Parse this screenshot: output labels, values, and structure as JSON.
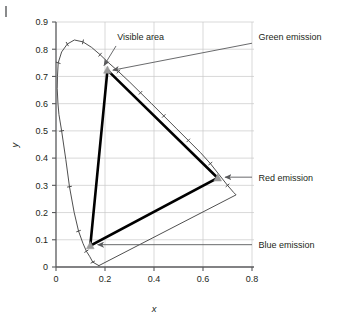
{
  "figure": {
    "corner_mark": "|",
    "background": "#ffffff"
  },
  "chart_data": {
    "type": "line",
    "title": "",
    "xlabel": "x",
    "ylabel": "y",
    "xlim": [
      0,
      0.8
    ],
    "ylim": [
      0,
      0.9
    ],
    "xticks": [
      "0",
      "0.2",
      "0.4",
      "0.6",
      "0.8"
    ],
    "xtick_values": [
      0,
      0.2,
      0.4,
      0.6,
      0.8
    ],
    "yticks": [
      "0",
      "0.1",
      "0.2",
      "0.3",
      "0.4",
      "0.5",
      "0.6",
      "0.7",
      "0.8",
      "0.9"
    ],
    "ytick_values": [
      0,
      0.1,
      0.2,
      0.3,
      0.4,
      0.5,
      0.6,
      0.7,
      0.8,
      0.9
    ],
    "grid": true,
    "grid_color": "#c8c8c8",
    "axis_color": "#58595b",
    "legend": "none",
    "series": [
      {
        "name": "Visible area",
        "kind": "spectral-locus",
        "color": "#3b3b3b",
        "closed": true,
        "points": [
          [
            0.175,
            0.005
          ],
          [
            0.15,
            0.018
          ],
          [
            0.138,
            0.038
          ],
          [
            0.124,
            0.058
          ],
          [
            0.11,
            0.087
          ],
          [
            0.092,
            0.132
          ],
          [
            0.074,
            0.201
          ],
          [
            0.055,
            0.295
          ],
          [
            0.04,
            0.395
          ],
          [
            0.023,
            0.5
          ],
          [
            0.012,
            0.56
          ],
          [
            0.008,
            0.6
          ],
          [
            0.005,
            0.655
          ],
          [
            0.006,
            0.7
          ],
          [
            0.009,
            0.75
          ],
          [
            0.023,
            0.79
          ],
          [
            0.046,
            0.819
          ],
          [
            0.075,
            0.834
          ],
          [
            0.11,
            0.827
          ],
          [
            0.145,
            0.807
          ],
          [
            0.18,
            0.78
          ],
          [
            0.215,
            0.75
          ],
          [
            0.255,
            0.718
          ],
          [
            0.3,
            0.68
          ],
          [
            0.345,
            0.64
          ],
          [
            0.39,
            0.6
          ],
          [
            0.44,
            0.555
          ],
          [
            0.49,
            0.51
          ],
          [
            0.54,
            0.465
          ],
          [
            0.59,
            0.42
          ],
          [
            0.63,
            0.38
          ],
          [
            0.665,
            0.34
          ],
          [
            0.7,
            0.3
          ],
          [
            0.725,
            0.274
          ],
          [
            0.735,
            0.265
          ],
          [
            0.175,
            0.005
          ]
        ],
        "tick_points": [
          [
            0.15,
            0.018
          ],
          [
            0.124,
            0.058
          ],
          [
            0.092,
            0.132
          ],
          [
            0.055,
            0.295
          ],
          [
            0.023,
            0.5
          ],
          [
            0.009,
            0.75
          ],
          [
            0.046,
            0.819
          ],
          [
            0.11,
            0.827
          ],
          [
            0.18,
            0.78
          ],
          [
            0.255,
            0.718
          ],
          [
            0.345,
            0.64
          ],
          [
            0.44,
            0.555
          ],
          [
            0.54,
            0.465
          ],
          [
            0.63,
            0.38
          ],
          [
            0.7,
            0.3
          ]
        ]
      },
      {
        "name": "Gamut triangle",
        "kind": "gamut",
        "color": "#000000",
        "closed": true,
        "points": [
          [
            0.21,
            0.723
          ],
          [
            0.66,
            0.327
          ],
          [
            0.14,
            0.078
          ],
          [
            0.21,
            0.723
          ]
        ]
      }
    ],
    "markers": [
      {
        "name": "green-emission-vertex",
        "x": 0.21,
        "y": 0.723,
        "shape": "triangle",
        "color": "#9b9b9b"
      },
      {
        "name": "red-emission-vertex",
        "x": 0.66,
        "y": 0.327,
        "shape": "triangle",
        "color": "#9b9b9b"
      },
      {
        "name": "blue-emission-vertex",
        "x": 0.14,
        "y": 0.078,
        "shape": "triangle",
        "color": "#9b9b9b"
      }
    ],
    "annotations": [
      {
        "id": "visible-area",
        "label": "Visible area",
        "text_x": 0.25,
        "text_y": 0.845,
        "arrow_from_x": 0.245,
        "arrow_from_y": 0.812,
        "arrow_to_x": 0.196,
        "arrow_to_y": 0.74
      },
      {
        "id": "green-emission",
        "label": "Green emission",
        "text_x": 0.818,
        "text_y": 0.845,
        "arrow_from_x": 0.8,
        "arrow_from_y": 0.822,
        "arrow_to_x": 0.232,
        "arrow_to_y": 0.723
      },
      {
        "id": "red-emission",
        "label": "Red emission",
        "text_x": 0.818,
        "text_y": 0.33,
        "arrow_from_x": 0.8,
        "arrow_from_y": 0.33,
        "arrow_to_x": 0.69,
        "arrow_to_y": 0.33
      },
      {
        "id": "blue-emission",
        "label": "Blue emission",
        "text_x": 0.818,
        "text_y": 0.082,
        "arrow_from_x": 0.8,
        "arrow_from_y": 0.082,
        "arrow_to_x": 0.17,
        "arrow_to_y": 0.082
      }
    ]
  }
}
